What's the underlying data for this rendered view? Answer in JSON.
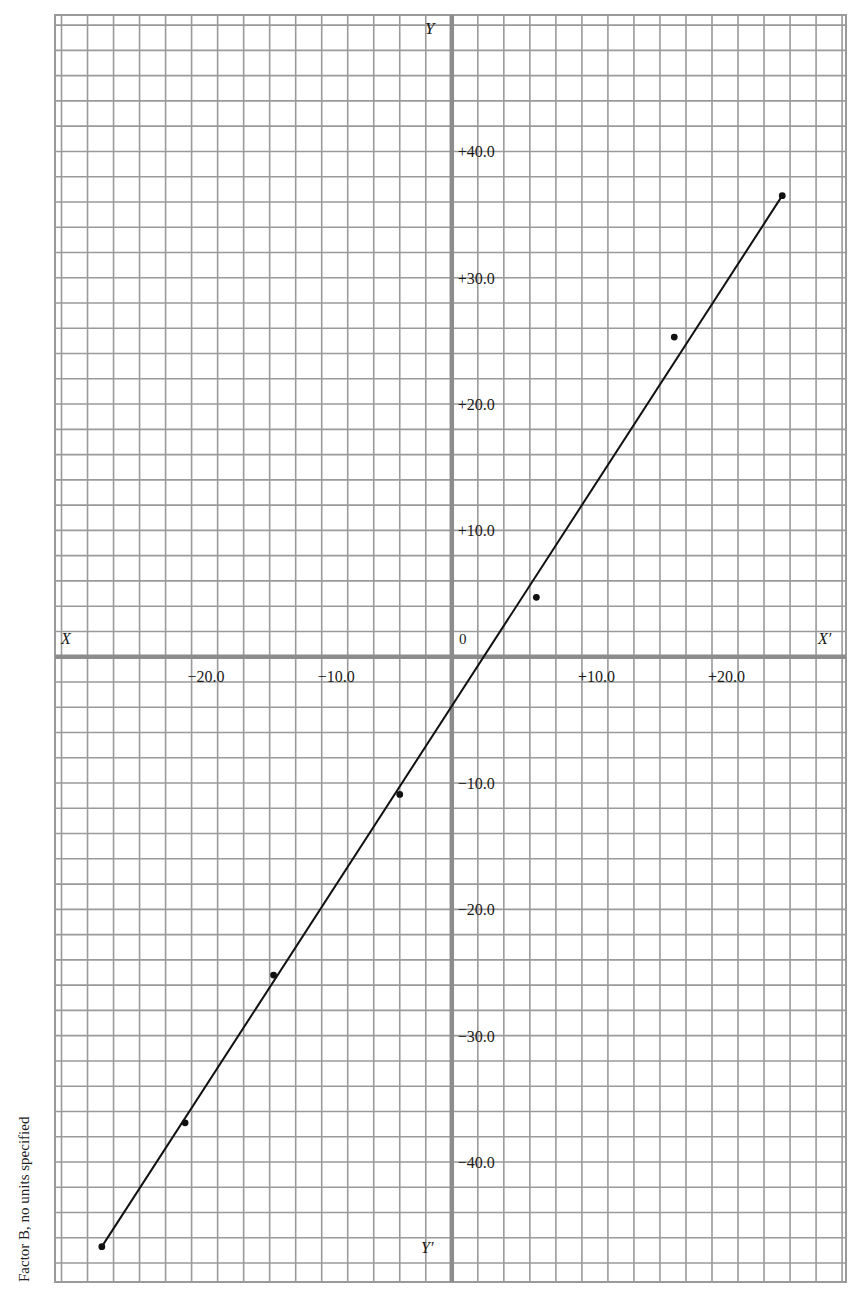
{
  "chart_data": {
    "type": "scatter",
    "title": "",
    "xlabel": "",
    "ylabel": "Factor B, no units specified",
    "axis_labels": {
      "x_neg": "X",
      "x_pos": "X′",
      "y_pos": "Y",
      "y_neg": "Y′",
      "origin": "0"
    },
    "x_ticks": [
      {
        "value": -20,
        "label": "−20.0"
      },
      {
        "value": -10,
        "label": "−10.0"
      },
      {
        "value": 10,
        "label": "+10.0"
      },
      {
        "value": 20,
        "label": "+20.0"
      }
    ],
    "y_ticks": [
      {
        "value": 40,
        "label": "+40.0"
      },
      {
        "value": 30,
        "label": "+30.0"
      },
      {
        "value": 20,
        "label": "+20.0"
      },
      {
        "value": 10,
        "label": "+10.0"
      },
      {
        "value": -10,
        "label": "−10.0"
      },
      {
        "value": -20,
        "label": "−20.0"
      },
      {
        "value": -30,
        "label": "−30.0"
      },
      {
        "value": -40,
        "label": "−40.0"
      }
    ],
    "xlim": [
      -30.5,
      30.3
    ],
    "ylim": [
      -49.5,
      50.8
    ],
    "grid": true,
    "grid_step": 2,
    "legend": null,
    "points": [
      {
        "x": -26.9,
        "y": -46.7
      },
      {
        "x": -20.5,
        "y": -36.9
      },
      {
        "x": -13.7,
        "y": -25.2
      },
      {
        "x": -4.0,
        "y": -10.9
      },
      {
        "x": 6.5,
        "y": 4.7
      },
      {
        "x": 17.1,
        "y": 25.3
      },
      {
        "x": 25.4,
        "y": 36.5
      }
    ],
    "fit_line": {
      "from": {
        "x": -26.9,
        "y": -46.7
      },
      "to": {
        "x": 25.4,
        "y": 36.5
      }
    }
  },
  "side_caption": "Factor B, no units specified",
  "colors": {
    "grid": "#9a9a9a",
    "axis": "#8c8c8c",
    "ink": "#111111",
    "background": "#ffffff"
  }
}
